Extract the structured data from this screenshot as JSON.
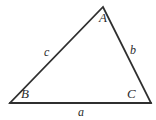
{
  "figure": {
    "type": "geometry-diagram",
    "shape": "triangle",
    "background_color": "#ffffff",
    "stroke_color": "#2f2f2f",
    "label_color": "#2b2b2b"
  },
  "vertices": [
    {
      "id": "A",
      "label": "A",
      "x": 103,
      "y": 7,
      "position": "apex-top"
    },
    {
      "id": "B",
      "label": "B",
      "x": 10,
      "y": 103,
      "position": "bottom-left"
    },
    {
      "id": "C",
      "label": "C",
      "x": 151,
      "y": 103,
      "position": "bottom-right"
    }
  ],
  "sides": [
    {
      "id": "a",
      "label": "a",
      "between": "B-C",
      "position": "below-base"
    },
    {
      "id": "b",
      "label": "b",
      "between": "A-C",
      "position": "right-outside"
    },
    {
      "id": "c",
      "label": "c",
      "between": "B-A",
      "position": "left-outside"
    }
  ]
}
